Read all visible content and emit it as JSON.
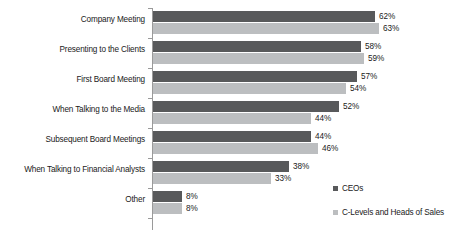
{
  "chart_data": {
    "type": "bar",
    "orientation": "horizontal",
    "title": "",
    "subtitle": "",
    "xlabel": "",
    "ylabel": "",
    "grid": false,
    "xlim": [
      0,
      70
    ],
    "legend_position": "right",
    "value_label_suffix": "%",
    "categories": [
      "Company Meeting",
      "Presenting to the Clients",
      "First Board Meeting",
      "When Talking to the Media",
      "Subsequent Board Meetings",
      "When Talking to Financial Analysts",
      "Other"
    ],
    "series": [
      {
        "name": "CEOs",
        "color": "#58595b",
        "values": [
          62,
          58,
          57,
          52,
          44,
          38,
          8
        ],
        "labels": [
          "62%",
          "58%",
          "57%",
          "52%",
          "44%",
          "38%",
          "8%"
        ]
      },
      {
        "name": "C-Levels and Heads of Sales",
        "color": "#bcbec0",
        "values": [
          63,
          59,
          54,
          44,
          46,
          33,
          8
        ],
        "labels": [
          "63%",
          "59%",
          "54%",
          "44%",
          "46%",
          "33%",
          "8%"
        ]
      }
    ]
  },
  "legend": {
    "items": [
      {
        "label": "CEOs",
        "marker": "square-marker"
      },
      {
        "label": "C-Levels and Heads of Sales",
        "marker": "square-marker"
      }
    ]
  }
}
